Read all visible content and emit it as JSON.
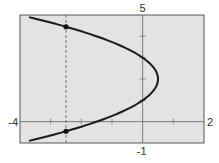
{
  "chart_data": {
    "type": "line",
    "title": "",
    "xlabel": "",
    "ylabel": "",
    "xlim": [
      -4,
      2
    ],
    "ylim": [
      -1,
      5
    ],
    "grid": false,
    "legend": null,
    "axis_labels": {
      "xmin": "-4",
      "xmax": "2",
      "ymin": "-1",
      "ymax": "5"
    },
    "x_ticks": [
      -3,
      -2,
      -1,
      1
    ],
    "y_ticks": [
      1,
      2,
      3,
      4
    ],
    "series": [
      {
        "name": "parabola opening left, x = 0.5 - 0.5(y - 2)^2",
        "equation": "x = 0.5 - 0.5(y-2)^2",
        "vertex": [
          0.5,
          2
        ],
        "y_range": [
          -0.9,
          4.9
        ],
        "points": [
          {
            "x": -3.7,
            "y": 4.9
          },
          {
            "x": -2.5,
            "y": 4.45
          },
          {
            "x": -1.5,
            "y": 4.0
          },
          {
            "x": 0.0,
            "y": 3.0
          },
          {
            "x": 0.5,
            "y": 2.0
          },
          {
            "x": 0.0,
            "y": 1.0
          },
          {
            "x": -1.5,
            "y": 0.0
          },
          {
            "x": -2.5,
            "y": -0.45
          },
          {
            "x": -3.7,
            "y": -0.9
          }
        ]
      }
    ],
    "annotations": [
      {
        "type": "vertical-dashed-line",
        "x": -2.5
      },
      {
        "type": "point",
        "x": -2.5,
        "y": 4.45
      },
      {
        "type": "point",
        "x": -2.5,
        "y": -0.45
      }
    ],
    "colors": {
      "plot_background": "#e3e3e3",
      "curve": "#1a1a1a",
      "axes": "#7a7a7a",
      "frame": "#555555"
    }
  }
}
